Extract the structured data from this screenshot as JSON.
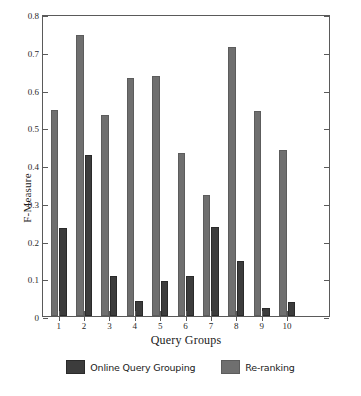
{
  "chart_data": {
    "type": "bar",
    "title": "",
    "xlabel": "Query Groups",
    "ylabel": "F-Measure",
    "categories": [
      "1",
      "2",
      "3",
      "4",
      "5",
      "6",
      "7",
      "8",
      "9",
      "10"
    ],
    "series": [
      {
        "name": "Online Query Grouping",
        "color": "#3c3c3c",
        "values": [
          0.232,
          0.427,
          0.106,
          0.039,
          0.093,
          0.107,
          0.235,
          0.146,
          0.02,
          0.037
        ]
      },
      {
        "name": "Re-ranking",
        "color": "#6f6f6f",
        "values": [
          0.545,
          0.745,
          0.532,
          0.63,
          0.637,
          0.431,
          0.32,
          0.712,
          0.544,
          0.441
        ]
      }
    ],
    "ylim": [
      0,
      0.8
    ],
    "yticks": [
      "0",
      "0.1",
      "0.2",
      "0.3",
      "0.4",
      "0.5",
      "0.6",
      "0.7",
      "0.8"
    ],
    "ytick_values": [
      0,
      0.1,
      0.2,
      0.3,
      0.4,
      0.5,
      0.6,
      0.7,
      0.8
    ],
    "grid": false,
    "legend_position": "bottom"
  },
  "legend": {
    "entries": [
      {
        "label": "Online Query Grouping"
      },
      {
        "label": "Re-ranking"
      }
    ]
  }
}
